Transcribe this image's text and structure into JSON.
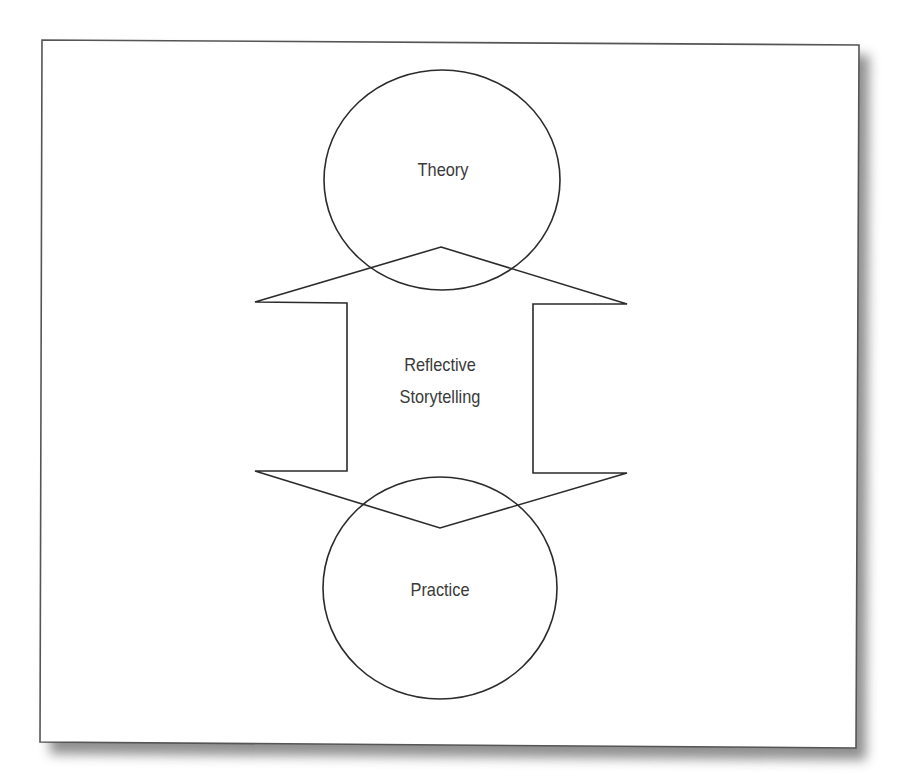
{
  "diagram": {
    "type": "concept-diagram",
    "nodes": [
      {
        "id": "theory",
        "label": "Theory",
        "shape": "circle"
      },
      {
        "id": "practice",
        "label": "Practice",
        "shape": "circle"
      }
    ],
    "connector": {
      "shape": "double-headed-arrow",
      "label_line1": "Reflective",
      "label_line2": "Storytelling",
      "connects": [
        "theory",
        "practice"
      ]
    },
    "colors": {
      "stroke": "#2b2b2b",
      "text": "#3a3a3a",
      "background": "#ffffff",
      "shadow": "#555555"
    }
  }
}
